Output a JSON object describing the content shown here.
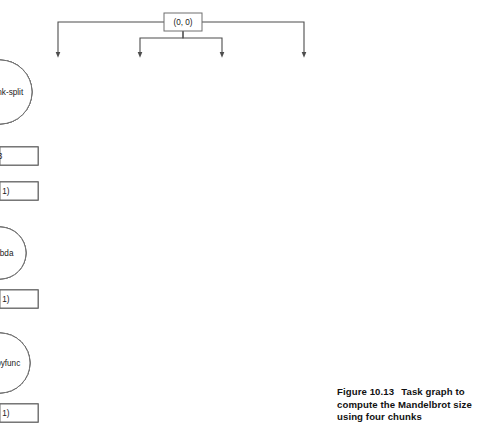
{
  "figure": {
    "caption_number": "Figure 10.13",
    "caption_text": "Task graph to compute the Mandelbrot size using four chunks"
  },
  "colors": {
    "node_stroke": "#6e6e6e",
    "edge_stroke": "#4d4d4d",
    "node_fill": "#ffffff",
    "background": "#ffffff",
    "text": "#1a1a1a"
  },
  "graph": {
    "type": "task-graph",
    "direction": "top-down",
    "root": {
      "id": "root",
      "shape": "box",
      "label": "(0, 0)",
      "x": 183,
      "y": 22
    },
    "columns": [
      {
        "index": 0,
        "x": 58,
        "nodes": [
          {
            "id": "c0-rechunk",
            "shape": "circle",
            "label": "rechunk-split",
            "y": 92,
            "r": 32
          },
          {
            "id": "c0-key",
            "shape": "box",
            "label": "0",
            "y": 156
          },
          {
            "id": "c0-chunk",
            "shape": "box",
            "label": "(0, 0)",
            "y": 191
          },
          {
            "id": "c0-lambda",
            "shape": "circle",
            "label": "lambda",
            "y": 253,
            "r": 26
          },
          {
            "id": "c0-mid",
            "shape": "box",
            "label": "(0, 0)",
            "y": 299
          },
          {
            "id": "c0-frompy",
            "shape": "circle",
            "label": "frompyfunc",
            "y": 363,
            "r": 30
          },
          {
            "id": "c0-out",
            "shape": "box",
            "label": "(0, 0)",
            "y": 413
          }
        ]
      },
      {
        "index": 1,
        "x": 140,
        "nodes": [
          {
            "id": "c1-rechunk",
            "shape": "circle",
            "label": "rechunk-split",
            "y": 92,
            "r": 32
          },
          {
            "id": "c1-key",
            "shape": "box",
            "label": "1",
            "y": 156
          },
          {
            "id": "c1-chunk",
            "shape": "box",
            "label": "(0, 1)",
            "y": 191
          },
          {
            "id": "c1-lambda",
            "shape": "circle",
            "label": "lambda",
            "y": 253,
            "r": 26
          },
          {
            "id": "c1-mid",
            "shape": "box",
            "label": "(0, 1)",
            "y": 299
          },
          {
            "id": "c1-frompy",
            "shape": "circle",
            "label": "frompyfunc",
            "y": 363,
            "r": 30
          },
          {
            "id": "c1-out",
            "shape": "box",
            "label": "(0, 1)",
            "y": 413
          }
        ]
      },
      {
        "index": 2,
        "x": 222,
        "nodes": [
          {
            "id": "c2-rechunk",
            "shape": "circle",
            "label": "rechunk-split",
            "y": 92,
            "r": 32
          },
          {
            "id": "c2-key",
            "shape": "box",
            "label": "2",
            "y": 156
          },
          {
            "id": "c2-chunk",
            "shape": "box",
            "label": "(1, 0)",
            "y": 191
          },
          {
            "id": "c2-lambda",
            "shape": "circle",
            "label": "lambda",
            "y": 253,
            "r": 26
          },
          {
            "id": "c2-mid",
            "shape": "box",
            "label": "(1, 0)",
            "y": 299
          },
          {
            "id": "c2-frompy",
            "shape": "circle",
            "label": "frompyfunc",
            "y": 363,
            "r": 30
          },
          {
            "id": "c2-out",
            "shape": "box",
            "label": "(1, 0)",
            "y": 413
          }
        ]
      },
      {
        "index": 3,
        "x": 304,
        "nodes": [
          {
            "id": "c3-rechunk",
            "shape": "circle",
            "label": "rechunk-split",
            "y": 92,
            "r": 32
          },
          {
            "id": "c3-key",
            "shape": "box",
            "label": "3",
            "y": 156
          },
          {
            "id": "c3-chunk",
            "shape": "box",
            "label": "(1, 1)",
            "y": 191
          },
          {
            "id": "c3-lambda",
            "shape": "circle",
            "label": "lambda",
            "y": 253,
            "r": 26
          },
          {
            "id": "c3-mid",
            "shape": "box",
            "label": "(1, 1)",
            "y": 299
          },
          {
            "id": "c3-frompy",
            "shape": "circle",
            "label": "frompyfunc",
            "y": 363,
            "r": 30
          },
          {
            "id": "c3-out",
            "shape": "box",
            "label": "(1, 1)",
            "y": 413
          }
        ]
      }
    ]
  }
}
